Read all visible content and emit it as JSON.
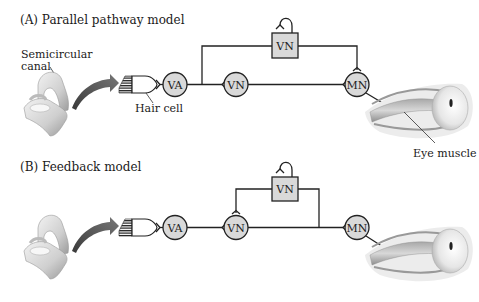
{
  "panels": [
    {
      "title": "(A)  Parallel pathway model",
      "labels": {
        "semicircular_canal_line1": "Semicircular",
        "semicircular_canal_line2": "canal",
        "hair_cell": "Hair cell",
        "eye_muscle": "Eye muscle"
      },
      "nodes": {
        "va": "VA",
        "vn_circle": "VN",
        "vn_box": "VN",
        "mn": "MN"
      }
    },
    {
      "title": "(B)  Feedback model",
      "nodes": {
        "va": "VA",
        "vn_circle": "VN",
        "vn_box": "VN",
        "mn": "MN"
      }
    }
  ],
  "colors": {
    "neuron_fill": "#d9d9d9",
    "line": "#222222",
    "arrow": "#555555"
  }
}
